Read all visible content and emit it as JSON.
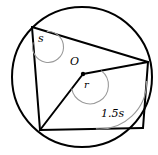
{
  "figure": {
    "name": "circle-with-inscribed-quadrilateral",
    "background_color": "#ffffff",
    "stroke_color": "#000000",
    "arc_color": "#9a9a9a",
    "width": 158,
    "height": 155
  },
  "circle": {
    "label": "circle",
    "center_x": 82,
    "center_y": 77,
    "radius": 70,
    "stroke_width": 2.0
  },
  "center_point": {
    "label": "O",
    "x": 83,
    "y": 74,
    "dot_radius": 2.2
  },
  "vertices": {
    "top_left": {
      "name": "A",
      "x": 32,
      "y": 27
    },
    "right": {
      "name": "B",
      "x": 148,
      "y": 62
    },
    "bottom_right": {
      "name": "C",
      "x": 143,
      "y": 128
    },
    "bottom_left": {
      "name": "D",
      "x": 40,
      "y": 130
    }
  },
  "chords": [
    {
      "name": "chord-top-left-to-right",
      "from": "top_left",
      "to": "right"
    },
    {
      "name": "chord-right-to-bottom-right",
      "from": "right",
      "to": "bottom_right"
    },
    {
      "name": "chord-bottom-right-to-bottom-left",
      "from": "bottom_right",
      "to": "bottom_left"
    },
    {
      "name": "chord-bottom-left-to-top-left",
      "from": "bottom_left",
      "to": "top_left"
    }
  ],
  "radii": [
    {
      "name": "radius-center-to-right",
      "from": "center",
      "to": "right"
    },
    {
      "name": "radius-center-to-bottom-left",
      "from": "center",
      "to": "bottom_left"
    }
  ],
  "angles": [
    {
      "id": "angle-s",
      "label": "s",
      "vertex": "top_left",
      "description": "inscribed angle at top-left vertex"
    },
    {
      "id": "angle-r",
      "label": "r",
      "vertex": "center",
      "description": "central angle at O"
    },
    {
      "id": "angle-1-5-s",
      "label": "1.5s",
      "vertex": "bottom_right",
      "description": "inscribed angle at bottom-right vertex"
    }
  ]
}
